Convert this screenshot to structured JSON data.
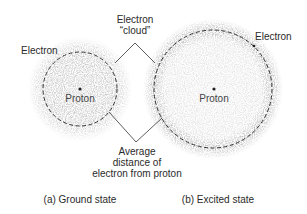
{
  "diagram": {
    "top_label": {
      "line1": "Electron",
      "line2": "“cloud”"
    },
    "bottom_label": {
      "line1": "Average",
      "line2": "distance of",
      "line3": "electron from proton"
    },
    "ground_state": {
      "electron_label": "Electron",
      "proton_label": "Proton",
      "caption": "(a) Ground state",
      "center": [
        80,
        89
      ],
      "radius": 37
    },
    "excited_state": {
      "electron_label": "Electron",
      "proton_label": "Proton",
      "caption": "(b) Excited state",
      "center": [
        213,
        89
      ],
      "radius": 59
    },
    "colors": {
      "cloud": "#9a9a9a",
      "dashed_circle": "#333333",
      "line": "#333333",
      "text": "#2a2a2a"
    }
  }
}
